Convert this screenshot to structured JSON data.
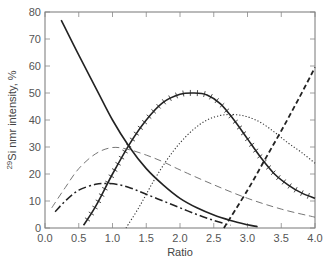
{
  "chart_data": {
    "type": "line",
    "title": "",
    "xlabel": "Ratio",
    "ylabel_prefix_sup": "29",
    "ylabel_text": "Si nmr intensity, %",
    "xlim": [
      0.0,
      4.0
    ],
    "ylim": [
      0,
      80
    ],
    "xticks": [
      "0.0",
      "0.5",
      "1.0",
      "1.5",
      "2.0",
      "2.5",
      "3.0",
      "3.5",
      "4.0"
    ],
    "yticks": [
      "0",
      "10",
      "20",
      "30",
      "40",
      "50",
      "60",
      "70",
      "80"
    ],
    "grid": false,
    "legend": "none",
    "series": [
      {
        "name": "solid-decreasing",
        "style": "solid",
        "points": [
          [
            0.24,
            77
          ],
          [
            0.5,
            64
          ],
          [
            0.75,
            52
          ],
          [
            1.0,
            40
          ],
          [
            1.25,
            30
          ],
          [
            1.5,
            22
          ],
          [
            1.75,
            16
          ],
          [
            2.0,
            11
          ],
          [
            2.25,
            7.5
          ],
          [
            2.5,
            4.8
          ],
          [
            2.75,
            2.8
          ],
          [
            3.0,
            1.2
          ],
          [
            3.15,
            0.5
          ]
        ]
      },
      {
        "name": "solid-with-ticks",
        "style": "solid-ticked",
        "points": [
          [
            0.57,
            1
          ],
          [
            0.75,
            8
          ],
          [
            1.0,
            20
          ],
          [
            1.25,
            31
          ],
          [
            1.5,
            40
          ],
          [
            1.75,
            46.5
          ],
          [
            2.0,
            49.5
          ],
          [
            2.2,
            50
          ],
          [
            2.4,
            49.3
          ],
          [
            2.6,
            46
          ],
          [
            2.8,
            40
          ],
          [
            3.0,
            33
          ],
          [
            3.2,
            26
          ],
          [
            3.4,
            20
          ],
          [
            3.6,
            16
          ],
          [
            3.8,
            13
          ],
          [
            4.0,
            11
          ]
        ]
      },
      {
        "name": "dotted",
        "style": "dotted",
        "points": [
          [
            1.2,
            0
          ],
          [
            1.4,
            8
          ],
          [
            1.6,
            17
          ],
          [
            1.8,
            25
          ],
          [
            2.0,
            31.5
          ],
          [
            2.2,
            36.5
          ],
          [
            2.4,
            40
          ],
          [
            2.6,
            41.7
          ],
          [
            2.8,
            42
          ],
          [
            3.0,
            41.2
          ],
          [
            3.2,
            39
          ],
          [
            3.4,
            35.5
          ],
          [
            3.6,
            31.5
          ],
          [
            3.8,
            28
          ],
          [
            4.0,
            24
          ]
        ]
      },
      {
        "name": "long-dash-thin",
        "style": "dashed-thin",
        "points": [
          [
            0.1,
            7.5
          ],
          [
            0.3,
            15
          ],
          [
            0.5,
            22
          ],
          [
            0.75,
            27.5
          ],
          [
            1.0,
            29.8
          ],
          [
            1.25,
            29
          ],
          [
            1.5,
            27
          ],
          [
            1.75,
            24.5
          ],
          [
            2.0,
            21.5
          ],
          [
            2.5,
            16
          ],
          [
            3.0,
            11
          ],
          [
            3.5,
            7
          ],
          [
            4.0,
            4
          ]
        ]
      },
      {
        "name": "dash-dot",
        "style": "dash-dot",
        "points": [
          [
            0.15,
            6
          ],
          [
            0.3,
            10
          ],
          [
            0.5,
            14
          ],
          [
            0.75,
            16.2
          ],
          [
            0.9,
            16.5
          ],
          [
            1.1,
            16
          ],
          [
            1.3,
            14.5
          ],
          [
            1.5,
            12.5
          ],
          [
            1.75,
            10
          ],
          [
            2.0,
            7.5
          ],
          [
            2.25,
            5
          ],
          [
            2.5,
            2.8
          ],
          [
            2.75,
            1
          ]
        ]
      },
      {
        "name": "thick-dashed-rising",
        "style": "dashed-thick",
        "points": [
          [
            2.65,
            0
          ],
          [
            3.0,
            14
          ],
          [
            3.25,
            25
          ],
          [
            3.5,
            36
          ],
          [
            3.75,
            47.5
          ],
          [
            4.0,
            59.5
          ]
        ]
      }
    ]
  }
}
